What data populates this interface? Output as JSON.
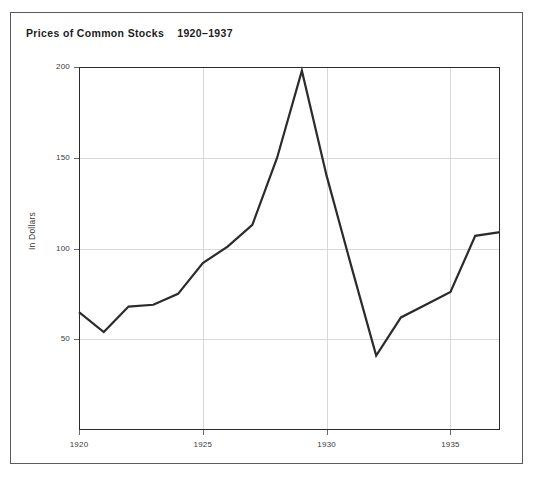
{
  "figure": {
    "title_main": "Prices of Common Stocks",
    "title_range": "1920–1937",
    "title_full": "Prices of Common Stocks    1920–1937",
    "background_color": "#ffffff",
    "frame_color": "#5b5b5b",
    "line_color": "#2b2b2b",
    "grid_color": "#d9d9d9"
  },
  "chart_data": {
    "type": "line",
    "title": "Prices of Common Stocks    1920–1937",
    "xlabel": "",
    "ylabel": "In Dollars",
    "xlim": [
      1920,
      1937
    ],
    "ylim": [
      0,
      200
    ],
    "grid": true,
    "legend": "none",
    "x_ticks": [
      1920,
      1925,
      1930,
      1935
    ],
    "x_tick_labels": [
      "1920",
      "1925",
      "1930",
      "1935"
    ],
    "y_ticks": [
      50,
      100,
      150,
      200
    ],
    "y_tick_labels": [
      "50",
      "100",
      "150",
      "200"
    ],
    "x": [
      1920,
      1921,
      1922,
      1923,
      1924,
      1925,
      1926,
      1927,
      1928,
      1929,
      1930,
      1931,
      1932,
      1933,
      1934,
      1935,
      1936,
      1937
    ],
    "values": [
      65,
      54,
      68,
      69,
      75,
      92,
      101,
      113,
      150,
      198,
      140,
      90,
      41,
      62,
      69,
      76,
      107,
      109
    ],
    "series": [
      {
        "name": "Prices of Common Stocks",
        "values": [
          65,
          54,
          68,
          69,
          75,
          92,
          101,
          113,
          150,
          198,
          140,
          90,
          41,
          62,
          69,
          76,
          107,
          109
        ]
      }
    ],
    "annotations": {
      "peak_year": 1929,
      "peak_value": 198,
      "trough_year": 1932,
      "trough_value": 41
    }
  }
}
